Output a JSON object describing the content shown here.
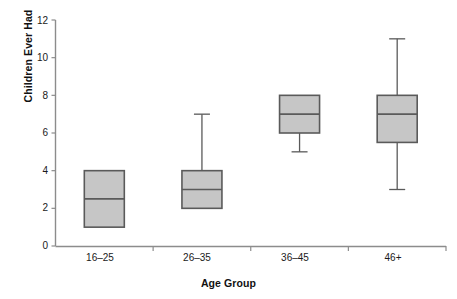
{
  "chart_data": {
    "type": "box",
    "title": "",
    "xlabel": "Age Group",
    "ylabel": "Children Ever Had",
    "ylim": [
      0,
      12
    ],
    "yticks": [
      0,
      2,
      4,
      6,
      8,
      10,
      12
    ],
    "grid": false,
    "legend": null,
    "categories": [
      "16–25",
      "26–35",
      "36–45",
      "46+"
    ],
    "boxes": [
      {
        "category": "16–25",
        "whisker_low": 1,
        "q1": 1,
        "median": 2.5,
        "q3": 4,
        "whisker_high": 4,
        "has_low_whisker": false,
        "has_high_whisker": false
      },
      {
        "category": "26–35",
        "whisker_low": 2,
        "q1": 2,
        "median": 3,
        "q3": 4,
        "whisker_high": 7,
        "has_low_whisker": false,
        "has_high_whisker": true
      },
      {
        "category": "36–45",
        "whisker_low": 5,
        "q1": 6,
        "median": 7,
        "q3": 8,
        "whisker_high": 8,
        "has_low_whisker": true,
        "has_high_whisker": false
      },
      {
        "category": "46+",
        "whisker_low": 3,
        "q1": 5.5,
        "median": 7,
        "q3": 8,
        "whisker_high": 11,
        "has_low_whisker": true,
        "has_high_whisker": true
      }
    ],
    "colors": {
      "box_fill": "#c6c6c6",
      "box_stroke": "#5a5a5a",
      "axis": "#8c8c8c",
      "text": "#1a1a1a"
    }
  },
  "axes": {
    "y_label": "Children Ever Had",
    "x_label": "Age Group",
    "y_tick_labels": [
      "0",
      "2",
      "4",
      "6",
      "8",
      "10",
      "12"
    ],
    "x_tick_labels": [
      "16–25",
      "26–35",
      "36–45",
      "46+"
    ]
  }
}
